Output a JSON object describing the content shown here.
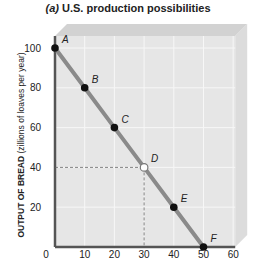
{
  "chart_data": {
    "type": "line",
    "title": "(a) U.S. production possibilities",
    "title_prefix": "(a)",
    "title_text": "U.S. production possibilities",
    "xlabel": "",
    "ylabel": "OUTPUT OF BREAD (zillions of loaves per year)",
    "ylabel_bold": "OUTPUT OF BREAD",
    "ylabel_rest": "(zillions of loaves per year)",
    "xlim": [
      0,
      60
    ],
    "ylim": [
      0,
      100
    ],
    "x_ticks": [
      "0",
      "10",
      "20",
      "30",
      "40",
      "50",
      "60"
    ],
    "y_ticks": [
      "20",
      "40",
      "60",
      "80",
      "100"
    ],
    "grid": true,
    "series": [
      {
        "name": "Production possibilities curve",
        "points": [
          {
            "label": "A",
            "x": 0,
            "y": 100,
            "filled": true
          },
          {
            "label": "B",
            "x": 10,
            "y": 80,
            "filled": true
          },
          {
            "label": "C",
            "x": 20,
            "y": 60,
            "filled": true
          },
          {
            "label": "D",
            "x": 30,
            "y": 40,
            "filled": false
          },
          {
            "label": "E",
            "x": 40,
            "y": 20,
            "filled": true
          },
          {
            "label": "F",
            "x": 50,
            "y": 0,
            "filled": true
          }
        ]
      }
    ],
    "annotations": [
      "Dashed guide lines from point D to x=30 and y=40"
    ]
  },
  "colors": {
    "curve": "#8a8a8a",
    "axis": "#555555",
    "plot_bg": "#e6e6e6",
    "grid": "#f7f7f7",
    "point": "#111111"
  }
}
